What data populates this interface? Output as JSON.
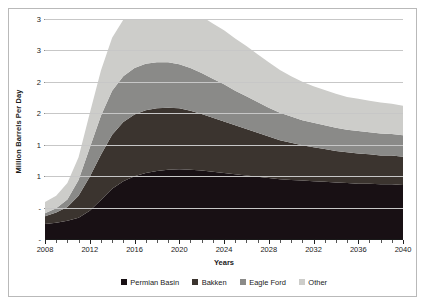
{
  "chart_data": {
    "type": "area",
    "stacked": true,
    "title": "",
    "xlabel": "Years",
    "ylabel": "Million Barrels Per Day",
    "xlim": [
      2008,
      2040
    ],
    "ylim": [
      0,
      3.5
    ],
    "grid": true,
    "legend_position": "bottom",
    "x": [
      2008,
      2009,
      2010,
      2011,
      2012,
      2013,
      2014,
      2015,
      2016,
      2017,
      2018,
      2019,
      2020,
      2021,
      2022,
      2023,
      2024,
      2025,
      2026,
      2027,
      2028,
      2029,
      2030,
      2031,
      2032,
      2033,
      2034,
      2035,
      2036,
      2037,
      2038,
      2039,
      2040
    ],
    "xtick_labels": [
      "2008",
      "2012",
      "2016",
      "2020",
      "2024",
      "2028",
      "2032",
      "2036",
      "2040"
    ],
    "xtick_values": [
      2008,
      2012,
      2016,
      2020,
      2024,
      2028,
      2032,
      2036,
      2040
    ],
    "ytick_labels": [
      "3",
      "3",
      "2",
      "2",
      "1",
      "1",
      "-"
    ],
    "ytick_values": [
      3.5,
      3.0,
      2.5,
      2.0,
      1.5,
      1.0,
      0.5
    ],
    "ytick_full_values": [
      "3.5",
      "3.0",
      "2.5",
      "2.0",
      "1.5",
      "1.0",
      "0.5",
      "-"
    ],
    "series": [
      {
        "name": "Permian Basin",
        "color": "#181014",
        "values": [
          0.24,
          0.26,
          0.29,
          0.34,
          0.45,
          0.62,
          0.8,
          0.92,
          1.0,
          1.05,
          1.08,
          1.1,
          1.11,
          1.1,
          1.09,
          1.07,
          1.05,
          1.03,
          1.01,
          0.99,
          0.97,
          0.95,
          0.94,
          0.93,
          0.92,
          0.91,
          0.9,
          0.89,
          0.88,
          0.88,
          0.87,
          0.87,
          0.86
        ]
      },
      {
        "name": "Bakken",
        "color": "#3b342f",
        "values": [
          0.12,
          0.16,
          0.22,
          0.35,
          0.54,
          0.72,
          0.86,
          0.94,
          0.98,
          1.0,
          1.0,
          0.99,
          0.97,
          0.94,
          0.9,
          0.86,
          0.82,
          0.78,
          0.74,
          0.7,
          0.66,
          0.62,
          0.59,
          0.56,
          0.54,
          0.52,
          0.5,
          0.49,
          0.48,
          0.47,
          0.46,
          0.46,
          0.45
        ]
      },
      {
        "name": "Eagle Ford",
        "color": "#8a8a88",
        "values": [
          0.05,
          0.07,
          0.12,
          0.25,
          0.46,
          0.62,
          0.7,
          0.73,
          0.74,
          0.74,
          0.73,
          0.72,
          0.7,
          0.68,
          0.65,
          0.62,
          0.59,
          0.55,
          0.52,
          0.49,
          0.46,
          0.44,
          0.42,
          0.4,
          0.39,
          0.38,
          0.37,
          0.36,
          0.36,
          0.35,
          0.35,
          0.34,
          0.34
        ]
      },
      {
        "name": "Other",
        "color": "#cdcdca",
        "values": [
          0.18,
          0.2,
          0.26,
          0.36,
          0.55,
          0.72,
          0.84,
          0.9,
          0.93,
          0.94,
          0.95,
          0.96,
          0.94,
          0.92,
          0.9,
          0.88,
          0.86,
          0.83,
          0.8,
          0.76,
          0.72,
          0.68,
          0.64,
          0.61,
          0.58,
          0.56,
          0.54,
          0.52,
          0.51,
          0.5,
          0.49,
          0.48,
          0.47
        ]
      }
    ],
    "totals": [
      0.59,
      0.69,
      0.89,
      1.3,
      2.0,
      2.68,
      3.2,
      3.49,
      3.65,
      3.73,
      3.76,
      3.77,
      3.72,
      3.64,
      3.54,
      3.43,
      3.32,
      3.19,
      3.07,
      2.94,
      2.81,
      2.69,
      2.59,
      2.5,
      2.43,
      2.37,
      2.31,
      2.26,
      2.23,
      2.2,
      2.17,
      2.15,
      2.12
    ]
  },
  "legend": {
    "items": [
      {
        "label": "Permian Basin",
        "color": "#181014"
      },
      {
        "label": "Bakken",
        "color": "#3b342f"
      },
      {
        "label": "Eagle Ford",
        "color": "#8a8a88"
      },
      {
        "label": "Other",
        "color": "#cdcdca"
      }
    ]
  },
  "axes": {
    "y_title": "Million Barrels Per Day",
    "x_title": "Years"
  }
}
